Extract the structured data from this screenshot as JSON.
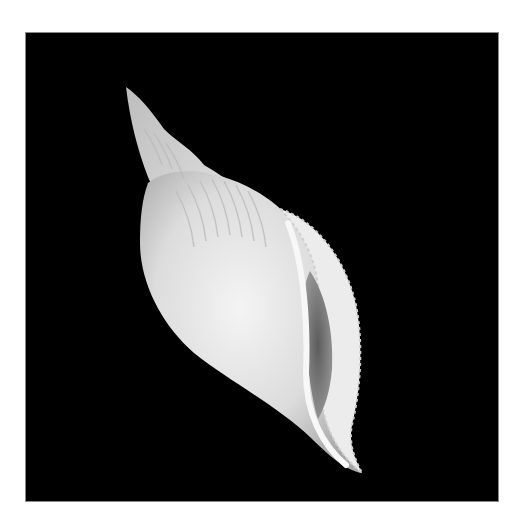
{
  "image": {
    "subject": "seashell",
    "alt": "White spired seashell photographed on a black background",
    "background_color": "#000000",
    "page_color": "#ffffff",
    "shell_colors": {
      "highlight": "#f2f2f2",
      "body": "#d8d8d8",
      "shadow": "#9a9a9a",
      "aperture": "#6e6e6e"
    }
  }
}
